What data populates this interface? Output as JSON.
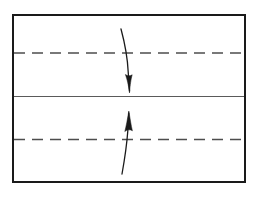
{
  "figure": {
    "title": "Two-region flow channel with opposing directional arrows",
    "background_color": "#ffffff",
    "width": 256,
    "height": 197,
    "frame": {
      "name": "outer-rectangle",
      "x": 13,
      "y": 15,
      "width": 232,
      "height": 167,
      "stroke_color": "#1a1a1a",
      "stroke_width": 2.0,
      "fill": "none"
    },
    "divider": {
      "name": "middle-solid-line",
      "x1": 14,
      "y1": 96.5,
      "x2": 244,
      "y2": 96.5,
      "stroke_color": "#5a5a5a",
      "stroke_width": 1.1
    },
    "dashed_lines": [
      {
        "name": "upper-centerline",
        "x1": 14,
        "y1": 53,
        "x2": 244,
        "y2": 53,
        "stroke_color": "#4d4d4d",
        "stroke_width": 1.6,
        "dash_length": 11,
        "gap_length": 7
      },
      {
        "name": "lower-centerline",
        "x1": 14,
        "y1": 139.5,
        "x2": 244,
        "y2": 139.5,
        "stroke_color": "#4d4d4d",
        "stroke_width": 1.6,
        "dash_length": 11,
        "gap_length": 7
      }
    ],
    "arrows": [
      {
        "name": "upper-arrow-downward",
        "direction": "down",
        "tail_x": 121,
        "tail_y": 29,
        "tip_x": 129.5,
        "tip_y": 93,
        "curve": "slight-s-bend",
        "path": "M121,29 C124.5,42 127.5,57 128.2,72 C128.8,81 129.2,87 129.5,91",
        "head_path": "M125.4,74.5 C127.1,79.5 128.4,84.5 129.5,93 C130.2,84.5 131.0,79.0 132.2,74.8 C130.2,76.3 127.4,76.0 125.4,74.5 Z",
        "stroke_color": "#1a1a1a",
        "stroke_width": 1.3
      },
      {
        "name": "lower-arrow-upward",
        "direction": "up",
        "tail_x": 122,
        "tail_y": 174,
        "tip_x": 128.8,
        "tip_y": 111,
        "curve": "slight-s-bend",
        "path": "M122,174 C124.5,160 126.8,145 127.8,131 C128.3,123 128.6,116 128.8,113",
        "head_path": "M124.8,131.5 C126.2,126.0 127.4,119.5 128.8,111 C130.3,119.5 131.1,125.5 132.4,130.8 C130.4,129.2 127.0,129.5 124.8,131.5 Z",
        "stroke_color": "#1a1a1a",
        "stroke_width": 1.3
      }
    ]
  }
}
